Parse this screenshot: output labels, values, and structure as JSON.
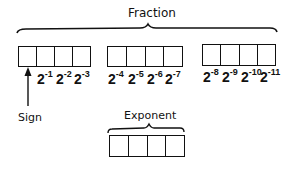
{
  "diagram": {
    "fraction_label": "Fraction",
    "exponent_label": "Exponent",
    "sign_label": "Sign",
    "fraction_groups": [
      {
        "cells": 4,
        "powers": [
          {
            "base": "2",
            "exp": "-1"
          },
          {
            "base": "2",
            "exp": "-2"
          },
          {
            "base": "2",
            "exp": "-3"
          }
        ]
      },
      {
        "cells": 4,
        "powers": [
          {
            "base": "2",
            "exp": "-4"
          },
          {
            "base": "2",
            "exp": "-5"
          },
          {
            "base": "2",
            "exp": "-6"
          },
          {
            "base": "2",
            "exp": "-7"
          }
        ]
      },
      {
        "cells": 4,
        "powers": [
          {
            "base": "2",
            "exp": "-8"
          },
          {
            "base": "2",
            "exp": "-9"
          },
          {
            "base": "2",
            "exp": "-10"
          },
          {
            "base": "2",
            "exp": "-11"
          }
        ]
      }
    ],
    "exponent_cells": 4,
    "line_color": "#111111"
  }
}
